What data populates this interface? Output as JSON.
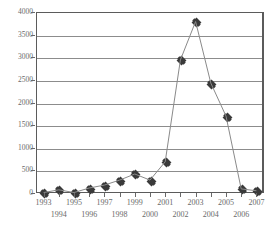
{
  "chart_data": {
    "type": "line",
    "title": "",
    "subtitle": "",
    "xlabel": "",
    "ylabel": "",
    "categories": [
      "1993",
      "1994",
      "1995",
      "1996",
      "1997",
      "1998",
      "1999",
      "2000",
      "2001",
      "2002",
      "2003",
      "2004",
      "2005",
      "2006",
      "2007"
    ],
    "values": [
      10,
      70,
      10,
      110,
      175,
      285,
      420,
      285,
      690,
      2940,
      3790,
      2430,
      1700,
      90,
      50
    ],
    "series": [
      {
        "name": "",
        "values": [
          10,
          70,
          10,
          110,
          175,
          285,
          420,
          285,
          690,
          2940,
          3790,
          2430,
          1700,
          90,
          50
        ]
      }
    ],
    "ylim": [
      0,
      4000
    ],
    "yticks": [
      0,
      500,
      1000,
      1500,
      2000,
      2500,
      3000,
      3500,
      4000
    ],
    "ytick_labels": [
      "0",
      "500",
      "1000",
      "1500",
      "2000",
      "2500",
      "3000",
      "3500",
      "4000"
    ],
    "xtick_labels": [
      "1993",
      "1994",
      "1995",
      "1996",
      "1997",
      "1998",
      "1999",
      "2000",
      "2001",
      "2002",
      "2003",
      "2004",
      "2005",
      "2006",
      "2007"
    ],
    "grid": true,
    "grid_axis": "y",
    "legend": false,
    "legend_position": "none",
    "marker": "diamond",
    "line_color": "#8a8a8a",
    "marker_color": "#3a3a3a",
    "grid_color": "#8c8c8c",
    "frame_color": "#5b5b5b",
    "text_color": "#6a6a6a",
    "annotations": []
  }
}
